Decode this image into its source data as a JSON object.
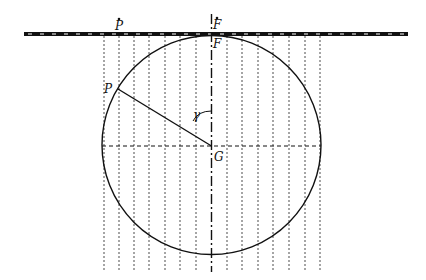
{
  "diagram": {
    "type": "geometry",
    "colors": {
      "line": "#111111",
      "background": "#ffffff"
    },
    "labels": {
      "p_bar": "P",
      "f_bar": "F",
      "f": "F",
      "p": "P",
      "gamma": "γ",
      "g": "G"
    },
    "circle": {
      "cx": 211.5,
      "cy": 145,
      "r": 109.5
    },
    "tangent_line": {
      "y": 34,
      "x1": 24,
      "x2": 408,
      "style": "thick dashed band"
    },
    "center_axis": {
      "x": 211.5,
      "y1": 14,
      "y2": 272,
      "style": "dash-dot"
    },
    "horizontal_diameter": {
      "y": 146,
      "x1": 102,
      "x2": 321,
      "style": "dashed"
    },
    "vertical_grid_x": [
      104,
      119,
      134,
      149,
      165,
      180,
      196,
      227,
      242,
      258,
      273,
      289,
      305,
      320
    ],
    "vertical_grid_range": {
      "y1": 36,
      "y2": 272
    },
    "points": {
      "P": {
        "x": 118,
        "y": 89
      },
      "G": {
        "x": 211.5,
        "y": 146
      },
      "F": {
        "x": 211.5,
        "y": 34
      },
      "P_bar": {
        "x": 119,
        "y": 34
      }
    }
  }
}
